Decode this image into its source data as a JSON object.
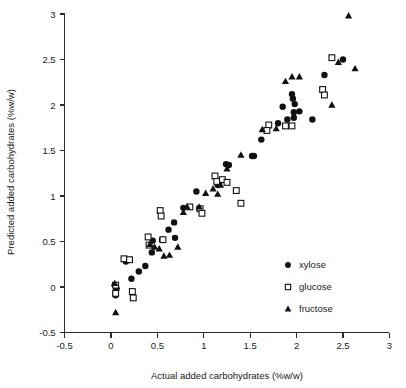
{
  "chart_data": {
    "type": "scatter",
    "title": "",
    "xlabel": "Actual added carbohydrates (%w/w)",
    "ylabel": "Predicted added carbohydrates (%w/w)",
    "xlim": [
      -0.5,
      3
    ],
    "ylim": [
      -0.5,
      3
    ],
    "xticks": [
      -0.5,
      0,
      0.5,
      1,
      1.5,
      2,
      2.5,
      3
    ],
    "yticks": [
      -0.5,
      0,
      0.5,
      1,
      1.5,
      2,
      2.5,
      3
    ],
    "xtick_labels": [
      "-0.5",
      "0",
      "0.5",
      "1",
      "1.5",
      "2",
      "2.5",
      "3"
    ],
    "ytick_labels": [
      "-0.5",
      "0",
      "0.5",
      "1",
      "1.5",
      "2",
      "2.5",
      "3"
    ],
    "grid": false,
    "legend_position": "center-right",
    "series": [
      {
        "name": "xylose",
        "marker": "filled-circle",
        "color": "#111111",
        "points": [
          [
            0.04,
            0.02
          ],
          [
            0.05,
            -0.05
          ],
          [
            0.06,
            -0.02
          ],
          [
            0.05,
            -0.09
          ],
          [
            0.16,
            0.28
          ],
          [
            0.22,
            0.09
          ],
          [
            0.3,
            0.17
          ],
          [
            0.37,
            0.23
          ],
          [
            0.44,
            0.38
          ],
          [
            0.45,
            0.51
          ],
          [
            0.55,
            0.52
          ],
          [
            0.62,
            0.63
          ],
          [
            0.68,
            0.71
          ],
          [
            0.69,
            0.54
          ],
          [
            0.78,
            0.87
          ],
          [
            0.92,
            1.05
          ],
          [
            0.95,
            0.86
          ],
          [
            1.15,
            1.12
          ],
          [
            1.17,
            1.16
          ],
          [
            1.24,
            1.35
          ],
          [
            1.27,
            1.34
          ],
          [
            1.52,
            1.44
          ],
          [
            1.54,
            1.44
          ],
          [
            1.62,
            1.62
          ],
          [
            1.8,
            1.8
          ],
          [
            1.85,
            1.98
          ],
          [
            1.9,
            1.84
          ],
          [
            1.95,
            2.12
          ],
          [
            1.96,
            2.07
          ],
          [
            1.97,
            1.92
          ],
          [
            1.97,
            1.86
          ],
          [
            1.98,
            2.01
          ],
          [
            2.03,
            1.93
          ],
          [
            2.17,
            1.84
          ],
          [
            2.3,
            2.33
          ],
          [
            2.5,
            2.5
          ]
        ]
      },
      {
        "name": "glucose",
        "marker": "open-square",
        "color": "#ffffff",
        "points": [
          [
            0.05,
            0.02
          ],
          [
            0.05,
            -0.07
          ],
          [
            0.14,
            0.31
          ],
          [
            0.2,
            0.3
          ],
          [
            0.23,
            -0.05
          ],
          [
            0.24,
            -0.12
          ],
          [
            0.4,
            0.55
          ],
          [
            0.41,
            0.46
          ],
          [
            0.53,
            0.84
          ],
          [
            0.54,
            0.78
          ],
          [
            0.56,
            0.52
          ],
          [
            0.85,
            0.88
          ],
          [
            0.96,
            0.86
          ],
          [
            0.98,
            0.81
          ],
          [
            1.12,
            1.22
          ],
          [
            1.14,
            1.16
          ],
          [
            1.2,
            1.18
          ],
          [
            1.25,
            1.15
          ],
          [
            1.35,
            1.06
          ],
          [
            1.4,
            0.92
          ],
          [
            1.7,
            1.78
          ],
          [
            1.68,
            1.72
          ],
          [
            1.88,
            1.77
          ],
          [
            1.95,
            1.77
          ],
          [
            2.28,
            2.17
          ],
          [
            2.3,
            2.11
          ],
          [
            2.38,
            2.52
          ]
        ]
      },
      {
        "name": "fructose",
        "marker": "filled-triangle",
        "color": "#111111",
        "points": [
          [
            0.04,
            0.04
          ],
          [
            0.05,
            -0.28
          ],
          [
            0.42,
            0.47
          ],
          [
            0.47,
            0.44
          ],
          [
            0.52,
            0.42
          ],
          [
            0.57,
            0.34
          ],
          [
            0.63,
            0.35
          ],
          [
            0.72,
            0.44
          ],
          [
            0.78,
            0.82
          ],
          [
            0.82,
            0.88
          ],
          [
            0.95,
            0.88
          ],
          [
            1.02,
            1.03
          ],
          [
            1.1,
            1.08
          ],
          [
            1.15,
            1.02
          ],
          [
            1.18,
            1.12
          ],
          [
            1.25,
            1.3
          ],
          [
            1.4,
            1.45
          ],
          [
            1.63,
            1.73
          ],
          [
            1.78,
            1.74
          ],
          [
            1.88,
            2.26
          ],
          [
            1.95,
            2.31
          ],
          [
            2.03,
            2.31
          ],
          [
            2.38,
            2.0
          ],
          [
            2.45,
            2.47
          ],
          [
            2.56,
            2.98
          ],
          [
            2.63,
            2.4
          ]
        ]
      }
    ]
  },
  "legend": {
    "items": [
      {
        "label": "xylose",
        "marker": "filled-circle"
      },
      {
        "label": "glucose",
        "marker": "open-square"
      },
      {
        "label": "fructose",
        "marker": "filled-triangle"
      }
    ]
  }
}
